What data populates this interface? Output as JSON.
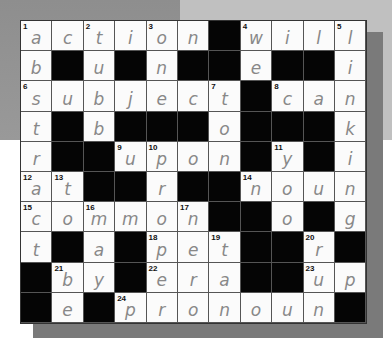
{
  "puzzle": {
    "type": "crossword",
    "columns": 11,
    "rows": 10,
    "black_symbol": "#",
    "grid": [
      [
        "a",
        "c",
        "t",
        "i",
        "o",
        "n",
        "#",
        "w",
        "i",
        "l",
        "l"
      ],
      [
        "b",
        "#",
        "u",
        "#",
        "n",
        "#",
        "#",
        "e",
        "#",
        "#",
        "i"
      ],
      [
        "s",
        "u",
        "b",
        "j",
        "e",
        "c",
        "t",
        "#",
        "c",
        "a",
        "n"
      ],
      [
        "t",
        "#",
        "b",
        "#",
        "#",
        "#",
        "o",
        "#",
        "#",
        "#",
        "k"
      ],
      [
        "r",
        "#",
        "#",
        "u",
        "p",
        "o",
        "n",
        "#",
        "y",
        "#",
        "i"
      ],
      [
        "a",
        "t",
        "#",
        "#",
        "r",
        "#",
        "#",
        "n",
        "o",
        "u",
        "n"
      ],
      [
        "c",
        "o",
        "m",
        "m",
        "o",
        "n",
        "#",
        "#",
        "o",
        "#",
        "g"
      ],
      [
        "t",
        "#",
        "a",
        "#",
        "p",
        "e",
        "t",
        "#",
        "#",
        "r",
        "#"
      ],
      [
        "#",
        "b",
        "y",
        "#",
        "e",
        "r",
        "a",
        "#",
        "#",
        "u",
        "p"
      ],
      [
        "#",
        "e",
        "#",
        "p",
        "r",
        "o",
        "n",
        "o",
        "u",
        "n",
        "#"
      ]
    ],
    "numbers": [
      {
        "n": "1",
        "row": 0,
        "col": 0
      },
      {
        "n": "2",
        "row": 0,
        "col": 2
      },
      {
        "n": "3",
        "row": 0,
        "col": 4
      },
      {
        "n": "4",
        "row": 0,
        "col": 7
      },
      {
        "n": "5",
        "row": 0,
        "col": 10
      },
      {
        "n": "6",
        "row": 2,
        "col": 0
      },
      {
        "n": "7",
        "row": 2,
        "col": 6
      },
      {
        "n": "8",
        "row": 2,
        "col": 8
      },
      {
        "n": "9",
        "row": 4,
        "col": 3
      },
      {
        "n": "10",
        "row": 4,
        "col": 4
      },
      {
        "n": "11",
        "row": 4,
        "col": 8
      },
      {
        "n": "12",
        "row": 5,
        "col": 0
      },
      {
        "n": "13",
        "row": 5,
        "col": 1
      },
      {
        "n": "14",
        "row": 5,
        "col": 7
      },
      {
        "n": "15",
        "row": 6,
        "col": 0
      },
      {
        "n": "16",
        "row": 6,
        "col": 2
      },
      {
        "n": "17",
        "row": 6,
        "col": 5
      },
      {
        "n": "18",
        "row": 7,
        "col": 4
      },
      {
        "n": "19",
        "row": 7,
        "col": 6
      },
      {
        "n": "20",
        "row": 7,
        "col": 9
      },
      {
        "n": "21",
        "row": 8,
        "col": 1
      },
      {
        "n": "22",
        "row": 8,
        "col": 4
      },
      {
        "n": "23",
        "row": 8,
        "col": 9
      },
      {
        "n": "24",
        "row": 9,
        "col": 3
      }
    ]
  }
}
